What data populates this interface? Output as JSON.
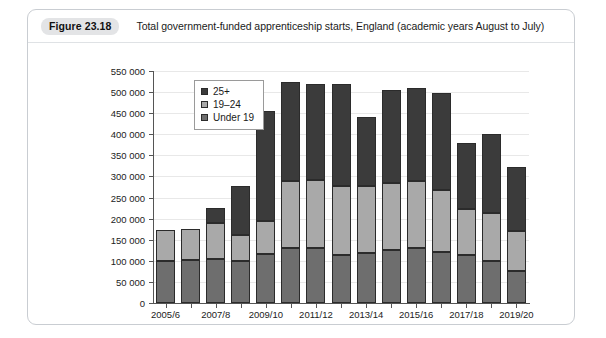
{
  "figure": {
    "badge": "Figure 23.18",
    "title": "Total government-funded apprenticeship starts, England (academic years August to July)"
  },
  "colors": {
    "25+": "#3b3b3b",
    "19-24": "#a9a9a9",
    "under-19": "#6e6e6e",
    "card_border": "#c9cdd2",
    "badge_bg": "#e3e4e6",
    "axis": "#555555",
    "gridline": "#e8e8e8"
  },
  "chart_data": {
    "type": "bar",
    "stacked": true,
    "title": "Total government-funded apprenticeship starts, England (academic years August to July)",
    "xlabel": "",
    "ylabel": "",
    "ylim": [
      0,
      550000
    ],
    "ytick_step": 50000,
    "ytick_labels": [
      "0",
      "50 000",
      "100 000",
      "150 000",
      "200 000",
      "250 000",
      "300 000",
      "350 000",
      "400 000",
      "450 000",
      "500 000",
      "550 000"
    ],
    "ytick_values": [
      0,
      50000,
      100000,
      150000,
      200000,
      250000,
      300000,
      350000,
      400000,
      450000,
      500000,
      550000
    ],
    "grid": true,
    "legend_position": "top-left",
    "categories": [
      "2005/6",
      "2006/7",
      "2007/8",
      "2008/9",
      "2009/10",
      "2010/11",
      "2011/12",
      "2012/13",
      "2013/14",
      "2014/15",
      "2015/16",
      "2016/17",
      "2017/18",
      "2018/19",
      "2019/20"
    ],
    "xtick_labels_shown": [
      "2005/6",
      "2007/8",
      "2009/10",
      "2011/12",
      "2013/14",
      "2015/16",
      "2017/18",
      "2019/20"
    ],
    "series": [
      {
        "name": "Under 19",
        "color": "#6e6e6e",
        "values": [
          99000,
          103000,
          105000,
          99000,
          117000,
          131000,
          130000,
          114000,
          119000,
          125000,
          131000,
          122000,
          114000,
          100000,
          76000
        ]
      },
      {
        "name": "19-24",
        "color": "#a9a9a9",
        "values": [
          75000,
          72000,
          84000,
          63000,
          77000,
          158000,
          162000,
          164000,
          159000,
          160000,
          159000,
          145000,
          108000,
          114000,
          94000
        ]
      },
      {
        "name": "25+",
        "color": "#3b3b3b",
        "values": [
          0,
          0,
          36000,
          116000,
          262000,
          234000,
          228000,
          241000,
          163000,
          220000,
          220000,
          230000,
          158000,
          186000,
          153000
        ]
      }
    ],
    "totals": [
      174000,
      175000,
      225000,
      278000,
      456000,
      523000,
      520000,
      519000,
      441000,
      505000,
      510000,
      497000,
      380000,
      400000,
      323000
    ]
  },
  "legend": {
    "items": [
      {
        "label": "25+",
        "color": "#3b3b3b"
      },
      {
        "label": "19-24",
        "color": "#a9a9a9"
      },
      {
        "label": "Under 19",
        "color": "#6e6e6e"
      }
    ]
  }
}
